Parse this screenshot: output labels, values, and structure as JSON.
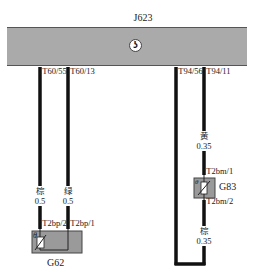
{
  "diagram": {
    "module": {
      "name": "J623",
      "logo_icon": "vw-logo-icon",
      "logo_glyph": "ʖ",
      "color": "#aaaaaa"
    },
    "pins": {
      "t60_55": "T60/55",
      "t60_13": "T60/13",
      "t94_56": "T94/56",
      "t94_11": "T94/11"
    },
    "wires": [
      {
        "id": "w1",
        "color_label": "棕",
        "gauge": "0.5"
      },
      {
        "id": "w2",
        "color_label": "绿",
        "gauge": "0.5"
      },
      {
        "id": "w3",
        "color_label": "黄",
        "gauge": "0.35"
      },
      {
        "id": "w4",
        "color_label": "棕",
        "gauge": "0.35"
      }
    ],
    "components": {
      "g62": {
        "name": "G62",
        "pin_a": "T2bp/2",
        "pin_b": "T2bp/1",
        "symbol": "θ"
      },
      "g83": {
        "name": "G83",
        "pin_a": "T2bm/1",
        "pin_b": "T2bm/2",
        "symbol": "θ"
      }
    }
  }
}
